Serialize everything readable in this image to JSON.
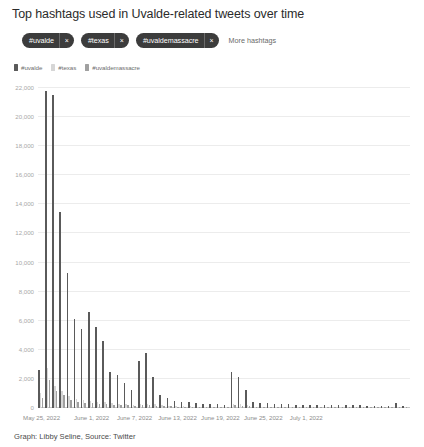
{
  "title": "Top hashtags used in Uvalde-related tweets over time",
  "filters": {
    "pills": [
      {
        "label": "#uvalde",
        "close": "×"
      },
      {
        "label": "#texas",
        "close": "×"
      },
      {
        "label": "#uvaldemassacre",
        "close": "×"
      }
    ],
    "more_label": "More hashtags"
  },
  "credit": "Graph: Libby Seline, Source: Twitter",
  "colors": {
    "uvalde": "#5a5a5a",
    "texas": "#d6d6d6",
    "uvaldemassacre": "#a0a0a0",
    "grid": "#ececec",
    "axis": "#c9c9c9",
    "pill_bg": "#3c3c3c"
  },
  "chart_data": {
    "type": "bar",
    "title": "Top hashtags used in Uvalde-related tweets over time",
    "xlabel": "",
    "ylabel": "",
    "ylim": [
      0,
      22000
    ],
    "grid": true,
    "legend_position": "top-left",
    "yticks": [
      0,
      2000,
      4000,
      6000,
      8000,
      10000,
      12000,
      14000,
      16000,
      18000,
      20000,
      22000
    ],
    "ytick_labels": [
      "0",
      "2,000",
      "4,000",
      "6,000",
      "8,000",
      "10,000",
      "12,000",
      "14,000",
      "16,000",
      "18,000",
      "20,000",
      "22,000"
    ],
    "xtick_labels": [
      "May 25, 2022",
      "June 1, 2022",
      "June 7, 2022",
      "June 13, 2022",
      "June 19, 2022",
      "June 25, 2022",
      "July 1, 2022"
    ],
    "xtick_indices": [
      0,
      7,
      13,
      19,
      25,
      31,
      37
    ],
    "categories": [
      "May 25, 2022",
      "May 26, 2022",
      "May 27, 2022",
      "May 28, 2022",
      "May 29, 2022",
      "May 30, 2022",
      "May 31, 2022",
      "June 1, 2022",
      "June 2, 2022",
      "June 3, 2022",
      "June 4, 2022",
      "June 5, 2022",
      "June 6, 2022",
      "June 7, 2022",
      "June 8, 2022",
      "June 9, 2022",
      "June 10, 2022",
      "June 11, 2022",
      "June 12, 2022",
      "June 13, 2022",
      "June 14, 2022",
      "June 15, 2022",
      "June 16, 2022",
      "June 17, 2022",
      "June 18, 2022",
      "June 19, 2022",
      "June 20, 2022",
      "June 21, 2022",
      "June 22, 2022",
      "June 23, 2022",
      "June 24, 2022",
      "June 25, 2022",
      "June 26, 2022",
      "June 27, 2022",
      "June 28, 2022",
      "June 29, 2022",
      "June 30, 2022",
      "July 1, 2022",
      "July 2, 2022",
      "July 3, 2022",
      "July 4, 2022",
      "July 5, 2022",
      "July 6, 2022",
      "July 7, 2022",
      "July 8, 2022",
      "July 9, 2022",
      "July 10, 2022",
      "July 11, 2022",
      "July 12, 2022",
      "July 13, 2022",
      "July 14, 2022",
      "July 15, 2022"
    ],
    "series": [
      {
        "name": "#uvalde",
        "color": "#5a5a5a",
        "values": [
          2600,
          21800,
          21500,
          13500,
          9300,
          6100,
          5400,
          6600,
          5600,
          4600,
          2500,
          2300,
          1700,
          1250,
          3200,
          3800,
          2150,
          900,
          700,
          500,
          430,
          380,
          330,
          300,
          280,
          260,
          240,
          2500,
          2100,
          1250,
          420,
          360,
          330,
          300,
          280,
          260,
          240,
          230,
          220,
          210,
          200,
          195,
          190,
          185,
          180,
          175,
          170,
          165,
          160,
          155,
          320,
          150
        ]
      },
      {
        "name": "#texas",
        "color": "#d6d6d6",
        "values": [
          1050,
          2750,
          1500,
          1200,
          800,
          620,
          520,
          480,
          430,
          390,
          340,
          300,
          270,
          240,
          260,
          290,
          250,
          180,
          150,
          130,
          120,
          110,
          100,
          95,
          90,
          88,
          85,
          300,
          260,
          180,
          95,
          88,
          82,
          78,
          74,
          70,
          66,
          64,
          62,
          60,
          58,
          56,
          54,
          52,
          50,
          48,
          46,
          44,
          42,
          40,
          70,
          38
        ]
      },
      {
        "name": "#uvaldemassacre",
        "color": "#a0a0a0",
        "values": [
          700,
          1900,
          1150,
          900,
          560,
          430,
          360,
          340,
          300,
          270,
          230,
          205,
          180,
          160,
          175,
          195,
          170,
          125,
          105,
          90,
          82,
          76,
          70,
          66,
          62,
          60,
          58,
          190,
          165,
          120,
          64,
          60,
          56,
          53,
          50,
          48,
          45,
          43,
          42,
          40,
          39,
          38,
          37,
          36,
          35,
          34,
          33,
          32,
          31,
          30,
          48,
          29
        ]
      }
    ]
  }
}
